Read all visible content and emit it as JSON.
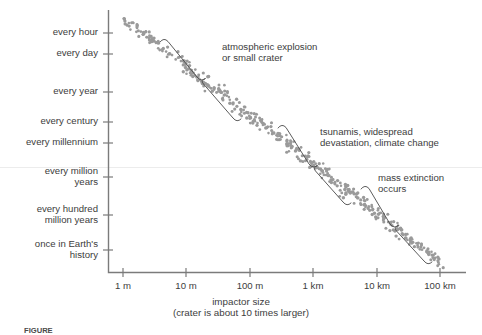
{
  "chart_data": {
    "type": "scatter",
    "title": "",
    "xlabel": "impactor size",
    "xlabel_sub": "(crater is about 10 times larger)",
    "ylabel": "",
    "x_tick_labels": [
      "1 m",
      "10 m",
      "100 m",
      "1 km",
      "10 km",
      "100 km"
    ],
    "x_tick_values": [
      1,
      10,
      100,
      1000,
      10000,
      100000
    ],
    "x_unit": "meters",
    "x_scale": "log",
    "y_tick_labels": [
      "every hour",
      "every day",
      "every year",
      "every century",
      "every millennium",
      "every million\nyears",
      "every hundred\nmillion years",
      "once in Earth's\nhistory"
    ],
    "y_scale": "log",
    "y_direction": "decreasing frequency downward",
    "grid": false,
    "legend": false,
    "trend": {
      "from": {
        "x_label": "1 m",
        "y_label": "every hour"
      },
      "to": {
        "x_label": "100 km",
        "y_label": "once in Earth's history"
      },
      "slope": "approximately -1 decade of frequency per decade of size"
    },
    "annotations": [
      {
        "id": "atmospheric-explosion",
        "text": "atmospheric explosion\nor small crater",
        "x_range": [
          "1 m",
          "1 km"
        ],
        "y_range": [
          "every hour",
          "every century"
        ]
      },
      {
        "id": "tsunamis",
        "text": "tsunamis, widespread\ndevastation, climate change",
        "x_range": [
          "1 km",
          "10 km"
        ],
        "y_range": [
          "every millennium",
          "every million years"
        ]
      },
      {
        "id": "mass-extinction",
        "text": "mass extinction\noccurs",
        "x_range": [
          "10 km",
          "100 km"
        ],
        "y_range": [
          "every million years",
          "once in Earth's history"
        ]
      }
    ],
    "colors": {
      "dot": "#9a9a9a",
      "axis": "#7b7b7b",
      "text": "#3d3d3d",
      "brace": "#4a4a4a"
    }
  },
  "axis": {
    "x_title": "impactor size",
    "x_subtitle": "(crater is about 10 times larger)"
  },
  "y_labels": [
    {
      "text": "every hour"
    },
    {
      "text": "every day"
    },
    {
      "text": "every year"
    },
    {
      "text": "every century"
    },
    {
      "text": "every millennium"
    },
    {
      "text": "every million\nyears"
    },
    {
      "text": "every hundred\nmillion years"
    },
    {
      "text": "once in Earth's\nhistory"
    }
  ],
  "x_labels": [
    {
      "text": "1 m"
    },
    {
      "text": "10 m"
    },
    {
      "text": "100 m"
    },
    {
      "text": "1 km"
    },
    {
      "text": "10 km"
    },
    {
      "text": "100 km"
    }
  ],
  "annotations": [
    {
      "text": "atmospheric explosion\nor small crater"
    },
    {
      "text": "tsunamis, widespread\ndevastation, climate change"
    },
    {
      "text": "mass extinction\noccurs"
    }
  ],
  "caption": {
    "label": "FIGURE",
    "text": ""
  }
}
